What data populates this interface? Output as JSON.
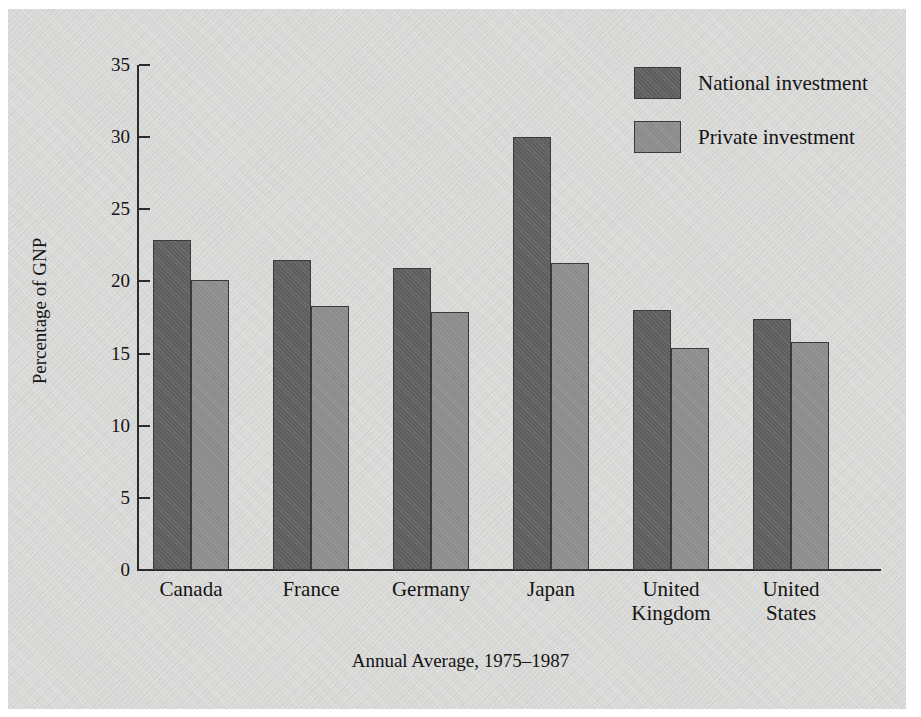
{
  "chart_data": {
    "type": "bar",
    "title": "",
    "xlabel": "Annual Average, 1975–1987",
    "ylabel": "Percentage of GNP",
    "categories": [
      "Canada",
      "France",
      "Germany",
      "Japan",
      "United\nKingdom",
      "United\nStates"
    ],
    "series": [
      {
        "name": "National investment",
        "color": "#5e5e5e",
        "values": [
          22.9,
          21.5,
          20.9,
          30.0,
          18.0,
          17.4
        ]
      },
      {
        "name": "Private investment",
        "color": "#8b8b8b",
        "values": [
          20.1,
          18.3,
          17.9,
          21.3,
          15.4,
          15.8
        ]
      }
    ],
    "ylim": [
      0,
      35
    ],
    "yticks": [
      0,
      5,
      10,
      15,
      20,
      25,
      30,
      35
    ],
    "ytick_labels": [
      "0",
      "5",
      "10",
      "15",
      "20",
      "25",
      "30",
      "35"
    ],
    "grid": false,
    "legend_position": "top-right"
  },
  "legend": {
    "entries": [
      {
        "label": "National investment",
        "color": "#5e5e5e",
        "swatch": "national"
      },
      {
        "label": "Private investment",
        "color": "#8b8b8b",
        "swatch": "private"
      }
    ]
  },
  "figure": {
    "background_color": "#d8d8d6",
    "page_color": "#ffffff",
    "axis_color": "#2b2b2b",
    "text_color": "#141414"
  }
}
